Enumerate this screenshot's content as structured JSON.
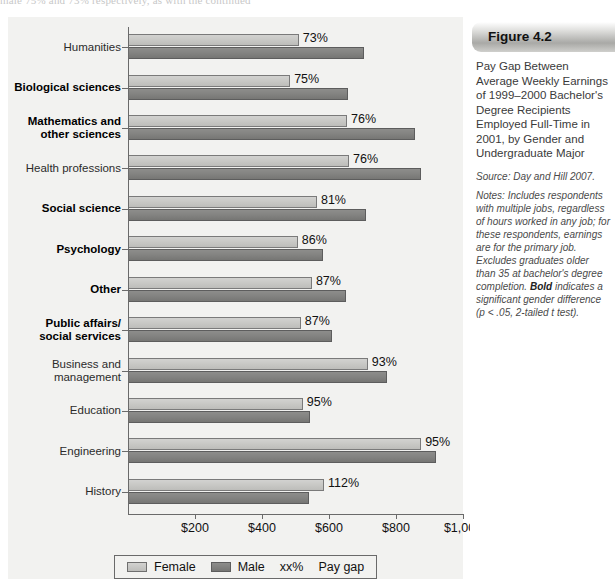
{
  "top_partial_text": "male 75% and 73% respectively, as with the continued",
  "figure": {
    "label": "Figure 4.2",
    "caption": "Pay Gap Between Average Weekly Earnings of 1999–2000 Bachelor's Degree Recipients Employed Full-Time in 2001, by Gender and Undergraduate Major",
    "source": "Source: Day and Hill 2007.",
    "notes_before_bold": "Notes: Includes respondents with multiple jobs, regardless of hours worked in any job; for these respondents, earnings are for the primary job. Excludes graduates older than 35 at bachelor's degree completion. ",
    "notes_bold": "Bold",
    "notes_after_bold": " indicates a significant gender difference (p < .05, 2-tailed t test)."
  },
  "legend": {
    "female_label": "Female",
    "male_label": "Male",
    "gap_label": "xx%",
    "gap_desc": "Pay gap"
  },
  "chart_data": {
    "type": "bar",
    "orientation": "horizontal",
    "title": "Pay Gap Between Average Weekly Earnings of 1999–2000 Bachelor's Degree Recipients Employed Full-Time in 2001, by Gender and Undergraduate Major",
    "xlabel": "",
    "ylabel": "",
    "xlim": [
      0,
      1000
    ],
    "grid": false,
    "legend_position": "bottom",
    "xticks": [
      0,
      200,
      400,
      600,
      800,
      1000
    ],
    "xtick_labels": [
      "",
      "$200",
      "$400",
      "$600",
      "$800",
      "$1,000"
    ],
    "categories": [
      "Humanities",
      "Biological sciences",
      "Mathematics and\nother sciences",
      "Health professions",
      "Social science",
      "Psychology",
      "Other",
      "Public affairs/\nsocial services",
      "Business and\nmanagement",
      "Education",
      "Engineering",
      "History"
    ],
    "category_bold": [
      false,
      true,
      true,
      false,
      true,
      true,
      true,
      true,
      false,
      false,
      false,
      false
    ],
    "series": [
      {
        "name": "Female",
        "values": [
          510,
          484,
          654,
          660,
          564,
          507,
          549,
          516,
          716,
          522,
          875,
          585
        ]
      },
      {
        "name": "Male",
        "values": [
          704,
          657,
          857,
          875,
          710,
          582,
          650,
          609,
          773,
          543,
          920,
          540
        ]
      }
    ],
    "pay_gap_labels": [
      "73%",
      "75%",
      "76%",
      "76%",
      "81%",
      "86%",
      "87%",
      "87%",
      "93%",
      "95%",
      "95%",
      "112%"
    ]
  }
}
